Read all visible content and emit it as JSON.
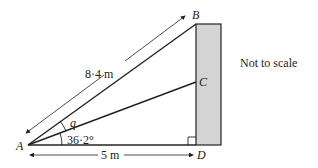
{
  "diagram": {
    "points": {
      "A": "A",
      "B": "B",
      "C": "C",
      "D": "D"
    },
    "labels": {
      "hypotenuse": "8·4 m",
      "base": "5 m",
      "angle_known": "36·2°",
      "angle_unknown": "q",
      "note": "Not to scale"
    },
    "colors": {
      "wall_fill": "#d4d4d4",
      "line": "#222222"
    }
  }
}
